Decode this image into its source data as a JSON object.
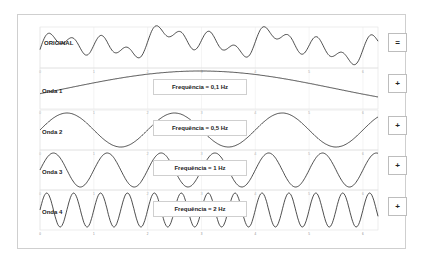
{
  "rows": [
    {
      "label": "ORIGINAL",
      "freq_label": null,
      "button": "="
    },
    {
      "label": "Onda 1",
      "freq_label": "Frequência = 0,1 Hz",
      "button": "+"
    },
    {
      "label": "Onda 2",
      "freq_label": "Frequência = 0,5 Hz",
      "button": "+"
    },
    {
      "label": "Onda 3",
      "freq_label": "Frequência = 1 Hz",
      "button": "+"
    },
    {
      "label": "Onda 4",
      "freq_label": "Frequência = 2 Hz",
      "button": "+"
    }
  ],
  "chart_data": [
    {
      "type": "line",
      "title": "ORIGINAL",
      "x_range": [
        0,
        6.28
      ],
      "ylim": [
        -2,
        2
      ],
      "xticks": [
        0,
        1,
        2,
        3,
        4,
        5,
        6
      ],
      "series": [
        {
          "name": "ORIGINAL",
          "formula": "sum of Onda 1..4"
        }
      ]
    },
    {
      "type": "line",
      "title": "Onda 1",
      "frequency_hz": 0.1,
      "x_range": [
        0,
        6.28
      ],
      "ylim": [
        -1,
        1
      ],
      "xticks": [
        0,
        1,
        2,
        3,
        4,
        5,
        6
      ]
    },
    {
      "type": "line",
      "title": "Onda 2",
      "frequency_hz": 0.5,
      "x_range": [
        0,
        6.28
      ],
      "ylim": [
        -1,
        1
      ],
      "xticks": [
        0,
        1,
        2,
        3,
        4,
        5,
        6
      ]
    },
    {
      "type": "line",
      "title": "Onda 3",
      "frequency_hz": 1,
      "x_range": [
        0,
        6.28
      ],
      "ylim": [
        -1,
        1
      ],
      "xticks": [
        0,
        1,
        2,
        3,
        4,
        5,
        6
      ]
    },
    {
      "type": "line",
      "title": "Onda 4",
      "frequency_hz": 2,
      "x_range": [
        0,
        6.28
      ],
      "ylim": [
        -1,
        1
      ],
      "xticks": [
        0,
        1,
        2,
        3,
        4,
        5,
        6
      ]
    }
  ]
}
